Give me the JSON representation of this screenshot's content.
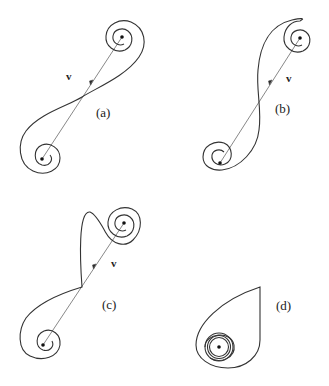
{
  "figure": {
    "panels": [
      {
        "id": "a",
        "label": "(a)",
        "vector_label": "v",
        "description": "S-shaped curve with spirals at both ends, crossing the connecting line"
      },
      {
        "id": "b",
        "label": "(b)",
        "vector_label": "v",
        "description": "Reverse S-shaped curve with spirals at both ends"
      },
      {
        "id": "c",
        "label": "(c)",
        "vector_label": "v",
        "description": "Curve with cusp at the midpoint of the connecting line"
      },
      {
        "id": "d",
        "label": "(d)",
        "description": "Teardrop loop with nested spiral around a single point"
      }
    ]
  }
}
